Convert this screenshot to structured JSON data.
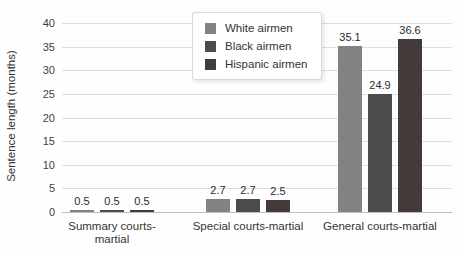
{
  "chart_data": {
    "type": "bar",
    "title": "",
    "xlabel": "",
    "ylabel": "Sentence length (months)",
    "ylim": [
      0,
      40
    ],
    "ytick_step": 5,
    "grid": true,
    "legend_position": "top-center",
    "categories": [
      "Summary courts-martial",
      "Special courts-martial",
      "General courts-martial"
    ],
    "series": [
      {
        "name": "White airmen",
        "color": "#828282",
        "values": [
          0.5,
          2.7,
          35.1
        ]
      },
      {
        "name": "Black airmen",
        "color": "#4c4c4e",
        "values": [
          0.5,
          2.7,
          24.9
        ]
      },
      {
        "name": "Hispanic airmen",
        "color": "#443a39",
        "values": [
          0.5,
          2.5,
          36.6
        ]
      }
    ]
  }
}
